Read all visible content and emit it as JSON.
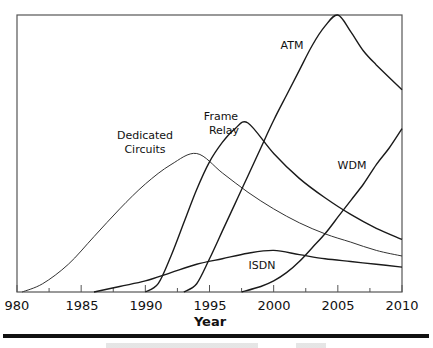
{
  "chart_data": {
    "type": "line",
    "title": "",
    "xlabel": "Year",
    "ylabel": "",
    "xlim": [
      1980,
      2010
    ],
    "ylim": [
      0,
      100
    ],
    "grid": false,
    "legend": "inline labels",
    "x_ticks": [
      1980,
      1985,
      1990,
      1995,
      2000,
      2005,
      2010
    ],
    "x_tick_labels": [
      "980",
      "1985",
      "1990",
      "1995",
      "2000",
      "2005",
      "2010"
    ],
    "series": [
      {
        "name": "Dedicated Circuits",
        "label_lines": [
          "Dedicated",
          "Circuits"
        ],
        "x": [
          1980.4,
          1982,
          1984,
          1986,
          1988,
          1990,
          1992,
          1994,
          1996,
          1998,
          2000,
          2002,
          2004,
          2006,
          2008,
          2010
        ],
        "values": [
          0,
          3,
          10,
          20,
          30,
          39,
          46,
          50,
          43,
          36,
          30,
          25,
          21,
          18,
          15,
          13
        ]
      },
      {
        "name": "Frame Relay",
        "label_lines": [
          "Frame",
          "Relay"
        ],
        "x": [
          1990,
          1991,
          1992,
          1993,
          1994,
          1995,
          1996,
          1997,
          1998,
          2000,
          2002,
          2004,
          2006,
          2008,
          2010
        ],
        "values": [
          0,
          3,
          13,
          25,
          37,
          47,
          54,
          59,
          61,
          50,
          41,
          34,
          28,
          23,
          19
        ]
      },
      {
        "name": "ATM",
        "label_lines": [
          "ATM"
        ],
        "x": [
          1993,
          1994,
          1995,
          1996,
          1997,
          1998,
          1999,
          2000,
          2001,
          2002,
          2003,
          2004,
          2005,
          2006,
          2007,
          2008,
          2010
        ],
        "values": [
          0,
          3,
          12,
          22,
          32,
          42,
          52,
          62,
          71,
          80,
          89,
          96,
          100,
          94,
          87,
          82,
          73
        ]
      },
      {
        "name": "ISDN",
        "label_lines": [
          "ISDN"
        ],
        "x": [
          1986,
          1988,
          1990,
          1992,
          1994,
          1996,
          1998,
          2000,
          2002,
          2004,
          2006,
          2008,
          2010
        ],
        "values": [
          0,
          2,
          4,
          7,
          10,
          12,
          14,
          15,
          13.5,
          12,
          11,
          10,
          9
        ]
      },
      {
        "name": "WDM",
        "label_lines": [
          "WDM"
        ],
        "x": [
          1997.5,
          1999,
          2000,
          2001,
          2002,
          2003,
          2004,
          2005,
          2006,
          2007,
          2008,
          2009,
          2010
        ],
        "values": [
          0,
          2,
          4,
          7,
          11,
          16,
          21,
          27,
          33,
          39,
          46,
          52,
          59
        ]
      }
    ]
  },
  "labels": {
    "x_axis_title": "Year",
    "series": {
      "dedicated_1": "Dedicated",
      "dedicated_2": "Circuits",
      "frame_1": "Frame",
      "frame_2": "Relay",
      "atm": "ATM",
      "isdn": "ISDN",
      "wdm": "WDM"
    },
    "ticks": [
      "980",
      "1985",
      "1990",
      "1995",
      "2000",
      "2005",
      "2010"
    ]
  }
}
